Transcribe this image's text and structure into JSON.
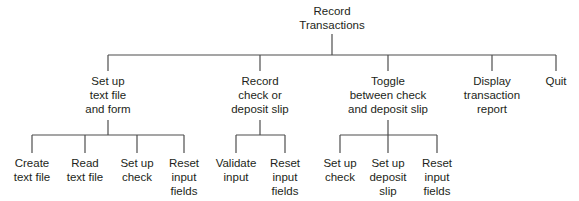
{
  "diagram": {
    "type": "hierarchy-chart",
    "root": {
      "id": "root",
      "label": "Record\nTransactions",
      "x": 332,
      "y": 4
    },
    "level1": [
      {
        "id": "setup",
        "label": "Set up\ntext file\nand form",
        "x": 108,
        "y": 74,
        "children": [
          {
            "id": "create-text-file",
            "label": "Create\ntext file",
            "x": 32,
            "y": 156
          },
          {
            "id": "read-text-file",
            "label": "Read\ntext file",
            "x": 85,
            "y": 156
          },
          {
            "id": "setup-check",
            "label": "Set up\ncheck",
            "x": 137,
            "y": 156
          },
          {
            "id": "reset-fields-1",
            "label": "Reset\ninput\nfields",
            "x": 184,
            "y": 156
          }
        ]
      },
      {
        "id": "record",
        "label": "Record\ncheck or\ndeposit slip",
        "x": 260,
        "y": 74,
        "children": [
          {
            "id": "validate-input",
            "label": "Validate\ninput",
            "x": 236,
            "y": 156
          },
          {
            "id": "reset-fields-2",
            "label": "Reset\ninput\nfields",
            "x": 285,
            "y": 156
          }
        ]
      },
      {
        "id": "toggle",
        "label": "Toggle\nbetween check\nand deposit slip",
        "x": 388,
        "y": 74,
        "children": [
          {
            "id": "setup-check-2",
            "label": "Set up\ncheck",
            "x": 340,
            "y": 156
          },
          {
            "id": "setup-deposit",
            "label": "Set up\ndeposit\nslip",
            "x": 388,
            "y": 156
          },
          {
            "id": "reset-fields-3",
            "label": "Reset\ninput\nfields",
            "x": 437,
            "y": 156
          }
        ]
      },
      {
        "id": "display",
        "label": "Display\ntransaction\nreport",
        "x": 492,
        "y": 74,
        "children": []
      },
      {
        "id": "quit",
        "label": "Quit",
        "x": 556,
        "y": 74,
        "children": []
      }
    ],
    "geometry": {
      "root_stem_top": 34,
      "bar1_y": 55,
      "level1_top": 74,
      "sub_stem_top": 120,
      "bar2_y": 135,
      "leaf_top": 156
    },
    "line_color": "#4d4d4d"
  }
}
